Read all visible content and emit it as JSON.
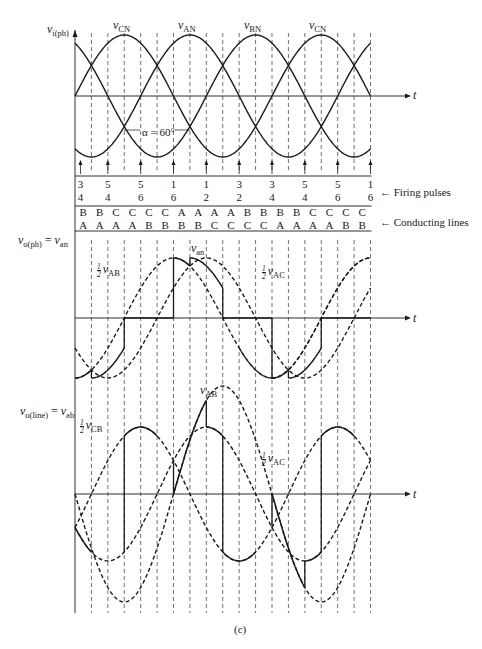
{
  "figure": {
    "caption": "(c)",
    "alpha_label": "α = 60°",
    "axis_t_label": "t"
  },
  "labels": {
    "input_axis": {
      "main": "v",
      "sub": "i(ph)"
    },
    "phase_output": {
      "lhs_main": "v",
      "lhs_sub": "o(ph)",
      "eq": " = ",
      "rhs_main": "v",
      "rhs_sub": "an"
    },
    "line_output": {
      "lhs_main": "v",
      "lhs_sub": "o(line)",
      "eq": " = ",
      "rhs_main": "v",
      "rhs_sub": "ab"
    },
    "firing_pulses": "Firing pulses",
    "conducting_lines": "Conducting lines",
    "input_curves": [
      {
        "main": "v",
        "sub": "CN"
      },
      {
        "main": "v",
        "sub": "AN"
      },
      {
        "main": "v",
        "sub": "BN"
      },
      {
        "main": "v",
        "sub": "CN"
      }
    ],
    "phase_curves": {
      "van": {
        "main": "v",
        "sub": "an"
      },
      "half_vab": {
        "num": "1",
        "den": "2",
        "main": "v",
        "sub": "AB"
      },
      "half_vac": {
        "num": "1",
        "den": "2",
        "main": "v",
        "sub": "AC"
      }
    },
    "line_curves": {
      "vab": {
        "main": "v",
        "sub": "AB"
      },
      "half_vcb": {
        "num": "1",
        "den": "2",
        "main": "v",
        "sub": "CB"
      },
      "half_vac": {
        "num": "1",
        "den": "2",
        "main": "v",
        "sub": "AC"
      }
    }
  },
  "firing_pulses": [
    {
      "top": "3",
      "bottom": "4"
    },
    {
      "top": "5",
      "bottom": "4"
    },
    {
      "top": "5",
      "bottom": "6"
    },
    {
      "top": "1",
      "bottom": "6"
    },
    {
      "top": "1",
      "bottom": "2"
    },
    {
      "top": "3",
      "bottom": "2"
    },
    {
      "top": "3",
      "bottom": "4"
    },
    {
      "top": "5",
      "bottom": "4"
    },
    {
      "top": "5",
      "bottom": "6"
    },
    {
      "top": "1",
      "bottom": "6"
    }
  ],
  "conducting_lines": [
    {
      "top": "B",
      "bottom": "A"
    },
    {
      "top": "B",
      "bottom": "A"
    },
    {
      "top": "C",
      "bottom": "A"
    },
    {
      "top": "C",
      "bottom": "A"
    },
    {
      "top": "C",
      "bottom": "B"
    },
    {
      "top": "C",
      "bottom": "B"
    },
    {
      "top": "A",
      "bottom": "B"
    },
    {
      "top": "A",
      "bottom": "B"
    },
    {
      "top": "A",
      "bottom": "C"
    },
    {
      "top": "A",
      "bottom": "C"
    },
    {
      "top": "B",
      "bottom": "C"
    },
    {
      "top": "B",
      "bottom": "C"
    },
    {
      "top": "B",
      "bottom": "A"
    },
    {
      "top": "B",
      "bottom": "A"
    },
    {
      "top": "C",
      "bottom": "A"
    },
    {
      "top": "C",
      "bottom": "A"
    },
    {
      "top": "C",
      "bottom": "B"
    },
    {
      "top": "C",
      "bottom": "B"
    }
  ],
  "chart_data": {
    "type": "line",
    "x_unit": "degrees",
    "x_range": [
      0,
      540
    ],
    "grid_step_deg": 30,
    "firing_angle_deg": 60,
    "plots": [
      {
        "name": "input phase voltages",
        "ylabel": "v_i(ph)",
        "series": [
          {
            "name": "v_AN",
            "phase_deg": -120,
            "amplitude": 1,
            "style": "solid"
          },
          {
            "name": "v_BN",
            "phase_deg": -240,
            "amplitude": 1,
            "style": "solid"
          },
          {
            "name": "v_CN",
            "phase_deg": 0,
            "amplitude": 1,
            "style": "solid"
          }
        ]
      },
      {
        "name": "output phase voltage",
        "ylabel": "v_o(ph) = v_an",
        "series": [
          {
            "name": "v_an",
            "style": "solid"
          },
          {
            "name": "1/2 v_AB",
            "style": "dashed"
          },
          {
            "name": "1/2 v_AC",
            "style": "dashed"
          }
        ]
      },
      {
        "name": "output line voltage",
        "ylabel": "v_o(line) = v_ab",
        "series": [
          {
            "name": "v_AB",
            "style": "solid"
          },
          {
            "name": "1/2 v_CB",
            "style": "dashed"
          },
          {
            "name": "1/2 v_AC",
            "style": "dashed"
          }
        ]
      }
    ]
  }
}
